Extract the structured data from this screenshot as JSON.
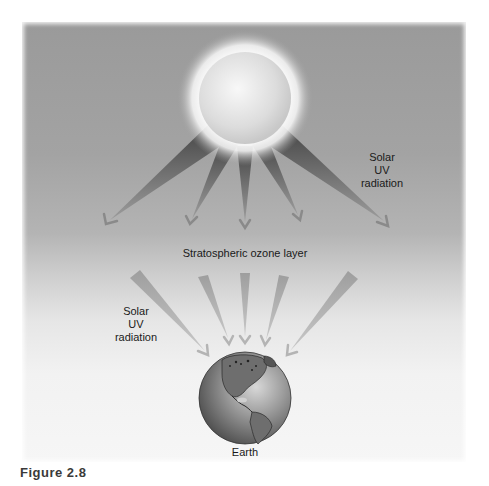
{
  "figure": {
    "label": "Figure 2.8"
  },
  "diagram": {
    "title_layer": "Stratospheric ozone layer",
    "upper_radiation_label": [
      "Solar",
      "UV",
      "radiation"
    ],
    "lower_radiation_label": [
      "Solar",
      "UV",
      "radiation"
    ],
    "earth_label": "Earth",
    "nodes": [
      {
        "id": "sun",
        "shape": "glowing-sphere",
        "cx": 245,
        "cy": 98,
        "r": 46
      },
      {
        "id": "earth",
        "shape": "globe",
        "cx": 245,
        "cy": 398,
        "r": 46
      }
    ],
    "upper_rays": [
      {
        "from": [
          218,
          133
        ],
        "to": [
          106,
          224
        ]
      },
      {
        "from": [
          231,
          143
        ],
        "to": [
          190,
          224
        ]
      },
      {
        "from": [
          245,
          146
        ],
        "to": [
          245,
          228
        ]
      },
      {
        "from": [
          259,
          143
        ],
        "to": [
          300,
          220
        ]
      },
      {
        "from": [
          272,
          133
        ],
        "to": [
          388,
          226
        ]
      }
    ],
    "lower_rays": [
      {
        "from": [
          135,
          273
        ],
        "to": [
          208,
          355
        ]
      },
      {
        "from": [
          203,
          275
        ],
        "to": [
          229,
          343
        ]
      },
      {
        "from": [
          245,
          273
        ],
        "to": [
          245,
          342
        ]
      },
      {
        "from": [
          283,
          275
        ],
        "to": [
          265,
          345
        ]
      },
      {
        "from": [
          353,
          275
        ],
        "to": [
          287,
          355
        ]
      }
    ],
    "colors": {
      "panel_top": "#9a9a9a",
      "panel_bottom": "#f6f6f6",
      "ray_dark": "#4a4a4a",
      "ray_light": "#b0b0b0",
      "sun": "#e4e4e4",
      "earth": "#7a7a7a"
    }
  }
}
